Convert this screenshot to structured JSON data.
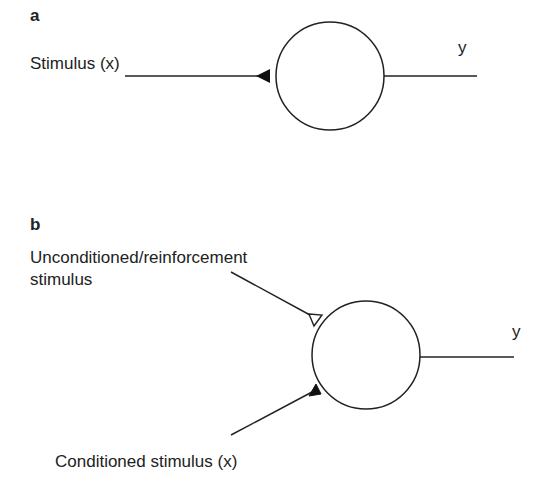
{
  "panels": {
    "a": {
      "label": "a",
      "input_label": "Stimulus (x)",
      "output_label": "y",
      "input_synapse": "filled-triangle"
    },
    "b": {
      "label": "b",
      "unconditioned_label_line1": "Unconditioned/reinforcement",
      "unconditioned_label_line2": "stimulus",
      "conditioned_label": "Conditioned stimulus (x)",
      "output_label": "y",
      "unconditioned_synapse": "open-triangle",
      "conditioned_synapse": "filled-triangle"
    }
  },
  "colors": {
    "stroke": "#222222",
    "background": "#ffffff"
  }
}
